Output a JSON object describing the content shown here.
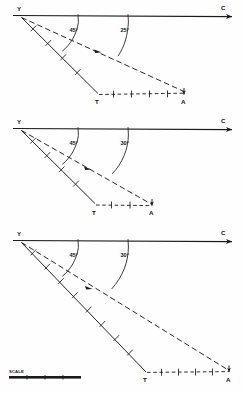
{
  "figure": {
    "title_visible": false,
    "type": "survey-vector-triangle-diagram",
    "panel_count": 3,
    "line_color": "#1a1a1a",
    "background": "#ffffff"
  },
  "labels": {
    "vertex": "Y",
    "course": "C",
    "track": "T",
    "aim": "A",
    "scale": "SCALE"
  },
  "panels": [
    {
      "id": "panel-1",
      "angle_solid": "45°",
      "angle_dashed": "25°",
      "vertex_label": "Y",
      "right_label": "C",
      "bottom_left_label": "T",
      "bottom_right_label": "A"
    },
    {
      "id": "panel-2",
      "angle_solid": "45°",
      "angle_dashed": "30°",
      "vertex_label": "Y",
      "right_label": "C",
      "bottom_left_label": "T",
      "bottom_right_label": "A"
    },
    {
      "id": "panel-3",
      "angle_solid": "45°",
      "angle_dashed": "30°",
      "vertex_label": "Y",
      "right_label": "C",
      "bottom_left_label": "T",
      "bottom_right_label": "A"
    }
  ],
  "scale_bar": {
    "label": "SCALE",
    "segments": 4
  }
}
